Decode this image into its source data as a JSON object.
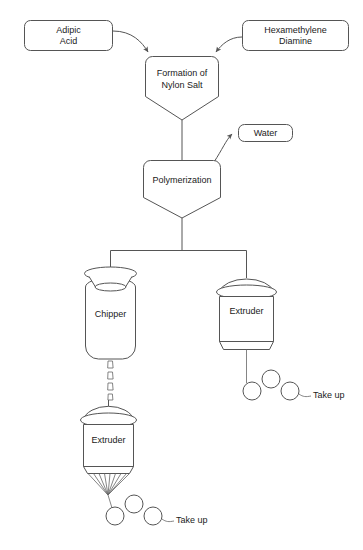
{
  "diagram": {
    "background_color": "#ffffff",
    "line_color": "#555555",
    "text_color": "#1a1a1a",
    "nodes": {
      "adipic_acid": {
        "label_line1": "Adipic",
        "label_line2": "Acid",
        "shape": "rounded-rectangle"
      },
      "hexamethylene_diamine": {
        "label_line1": "Hexamethylene",
        "label_line2": "Diamine",
        "shape": "rounded-rectangle"
      },
      "nylon_salt": {
        "label_line1": "Formation of",
        "label_line2": "Nylon Salt",
        "shape": "conical-bottom-vessel"
      },
      "water": {
        "label": "Water",
        "shape": "rounded-rectangle"
      },
      "polymerization": {
        "label": "Polymerization",
        "shape": "conical-bottom-vessel"
      },
      "chipper": {
        "label": "Chipper",
        "shape": "funnel-top-jar"
      },
      "extruder_right": {
        "label": "Extruder",
        "shape": "domed-cylinder"
      },
      "extruder_bottom": {
        "label": "Extruder",
        "shape": "domed-cylinder-with-spinneret"
      },
      "take_up_right": {
        "label": "Take up",
        "shape": "three-roller-take-up"
      },
      "take_up_bottom": {
        "label": "Take up",
        "shape": "three-roller-take-up"
      }
    },
    "connections": [
      {
        "from": "adipic_acid",
        "to": "nylon_salt",
        "style": "curved-arrow"
      },
      {
        "from": "hexamethylene_diamine",
        "to": "nylon_salt",
        "style": "curved-arrow"
      },
      {
        "from": "nylon_salt",
        "to": "polymerization",
        "style": "straight-line"
      },
      {
        "from": "polymerization",
        "to": "water",
        "style": "curved-arrow"
      },
      {
        "from": "polymerization",
        "to": "chipper",
        "style": "branch-line"
      },
      {
        "from": "polymerization",
        "to": "extruder_right",
        "style": "branch-line"
      },
      {
        "from": "chipper",
        "to": "extruder_bottom",
        "style": "chip-fall"
      },
      {
        "from": "extruder_right",
        "to": "take_up_right",
        "style": "fiber-line"
      },
      {
        "from": "extruder_bottom",
        "to": "take_up_bottom",
        "style": "spinneret-fiber"
      }
    ]
  }
}
